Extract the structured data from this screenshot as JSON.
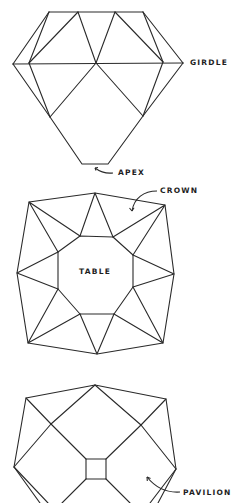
{
  "diagram": {
    "views": [
      {
        "id": "side",
        "name": "Side profile view"
      },
      {
        "id": "crown",
        "name": "Crown (top) view"
      },
      {
        "id": "pavilion",
        "name": "Pavilion (bottom) view"
      }
    ],
    "labels": {
      "girdle": "GIRDLE",
      "apex": "APEX",
      "crown": "CROWN",
      "table": "TABLE",
      "pavilion": "PAVILION"
    },
    "colors": {
      "line": "#2a2a2a",
      "text": "#1e1e1e",
      "background": "#ffffff"
    }
  }
}
